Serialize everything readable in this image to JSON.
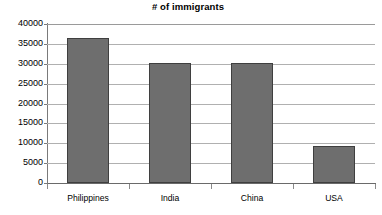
{
  "chart_data": {
    "type": "bar",
    "title": "# of immigrants",
    "xlabel": "",
    "ylabel": "",
    "categories": [
      "Philippines",
      "India",
      "China",
      "USA"
    ],
    "values": [
      36500,
      30200,
      30300,
      9400
    ],
    "ylim": [
      0,
      40000
    ],
    "ytick_labels": [
      "40000",
      "35000",
      "30000",
      "25000",
      "20000",
      "15000",
      "10000",
      "5000",
      "0"
    ],
    "ytick_values": [
      40000,
      35000,
      30000,
      25000,
      20000,
      15000,
      10000,
      5000,
      0
    ],
    "ytick_step": 5000,
    "grid": true,
    "legend": false,
    "legend_position": "none",
    "series": [
      {
        "name": "# of immigrants",
        "values": [
          36500,
          30200,
          30300,
          9400
        ],
        "color": "#6e6e6e"
      }
    ]
  },
  "style": {
    "bar_fill": "#6e6e6e",
    "bar_border": "#3f3f3f",
    "gridline_color": "#b0b0b0",
    "axis_color": "#7a7a7a",
    "background": "#ffffff",
    "text_color": "#000000"
  }
}
